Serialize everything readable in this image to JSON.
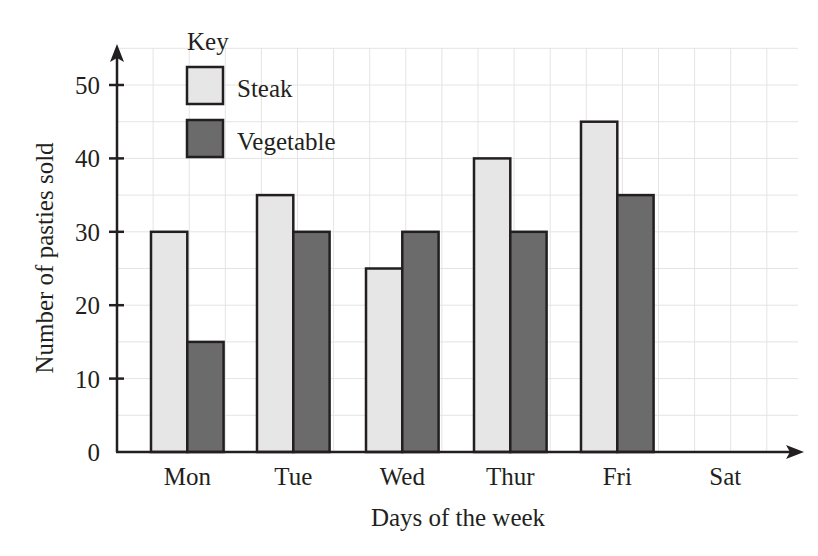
{
  "chart_data": {
    "type": "bar",
    "title": "",
    "xlabel": "Days of the week",
    "ylabel": "Number of pasties sold",
    "categories": [
      "Mon",
      "Tue",
      "Wed",
      "Thur",
      "Fri",
      "Sat"
    ],
    "series": [
      {
        "name": "Steak",
        "color": "#e6e6e6",
        "values": [
          30,
          35,
          25,
          40,
          45,
          null
        ]
      },
      {
        "name": "Vegetable",
        "color": "#6b6b6b",
        "values": [
          15,
          30,
          30,
          30,
          35,
          null
        ]
      }
    ],
    "yticks": [
      0,
      10,
      20,
      30,
      40,
      50
    ],
    "ylim": [
      0,
      50
    ],
    "grid": true,
    "grid_minor_step": 5,
    "legend": {
      "title": "Key",
      "position": "top-left-inside"
    }
  },
  "legend": {
    "title": "Key",
    "items": [
      {
        "label": "Steak",
        "color": "#e6e6e6"
      },
      {
        "label": "Vegetable",
        "color": "#6b6b6b"
      }
    ]
  },
  "axes": {
    "xlabel": "Days of the week",
    "ylabel": "Number of pasties sold",
    "yticks": [
      "0",
      "10",
      "20",
      "30",
      "40",
      "50"
    ],
    "xticks": [
      "Mon",
      "Tue",
      "Wed",
      "Thur",
      "Fri",
      "Sat"
    ]
  }
}
